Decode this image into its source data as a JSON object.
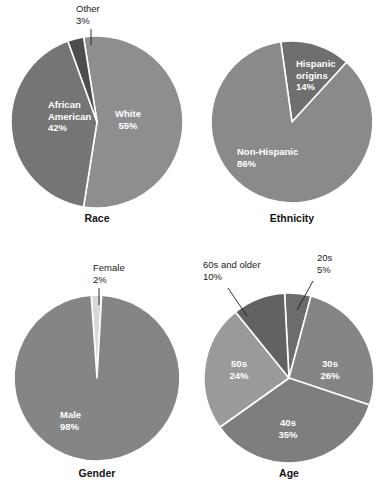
{
  "figure": {
    "background": "#ffffff",
    "slice_border_color": "#ffffff",
    "inner_label_color": "#ffffff",
    "callout_text_color": "#1a1a1a",
    "title_color": "#141414"
  },
  "chart_data": [
    {
      "type": "pie",
      "title": "Race",
      "id": "race",
      "start_angle_deg": -9,
      "legend": "none",
      "grid": false,
      "categories": [
        "White",
        "African American",
        "Other"
      ],
      "values": [
        55,
        42,
        3
      ],
      "slices": [
        {
          "label": "White",
          "value_label": "55%",
          "value": 55,
          "color": "#8e8e8e",
          "label_placement": "inside",
          "label_x": 128,
          "label_y": 117,
          "label_anchor": "middle"
        },
        {
          "label": "African American",
          "value_label": "42%",
          "value": 42,
          "color": "#757575",
          "label_placement": "inside",
          "label_lines": [
            "African",
            "American"
          ],
          "label_x": 48,
          "label_y": 108,
          "label_anchor": "start"
        },
        {
          "label": "Other",
          "value_label": "3%",
          "value": 3,
          "color": "#4d4d4d",
          "label_placement": "callout",
          "label_x": 76,
          "label_y": 12,
          "label_anchor": "start",
          "leader_x1": 91,
          "leader_y1": 29,
          "leader_x2": 91,
          "leader_y2": 45
        }
      ]
    },
    {
      "type": "pie",
      "title": "Ethnicity",
      "id": "ethnicity",
      "start_angle_deg": -8,
      "legend": "none",
      "grid": false,
      "categories": [
        "Non-Hispanic",
        "Hispanic origins"
      ],
      "values": [
        86,
        14
      ],
      "slices": [
        {
          "label": "Hispanic origins",
          "value_label": "14%",
          "value": 14,
          "color": "#6f6f6f",
          "label_placement": "inside",
          "label_lines": [
            "Hispanic",
            "origins"
          ],
          "label_x": 101,
          "label_y": 67,
          "label_anchor": "start"
        },
        {
          "label": "Non-Hispanic",
          "value_label": "86%",
          "value": 86,
          "color": "#8a8a8a",
          "label_placement": "inside",
          "label_x": 42,
          "label_y": 155,
          "label_anchor": "start"
        }
      ]
    },
    {
      "type": "pie",
      "title": "Gender",
      "id": "gender",
      "start_angle_deg": -4,
      "legend": "none",
      "grid": false,
      "categories": [
        "Male",
        "Female"
      ],
      "values": [
        98,
        2
      ],
      "slices": [
        {
          "label": "Female",
          "value_label": "2%",
          "value": 2,
          "color": "#d8d8d8",
          "label_placement": "callout",
          "label_x": 93,
          "label_y": 23,
          "label_anchor": "start",
          "leader_x1": 99,
          "leader_y1": 40,
          "leader_x2": 99,
          "leader_y2": 57
        },
        {
          "label": "Male",
          "value_label": "98%",
          "value": 98,
          "color": "#858585",
          "label_placement": "inside",
          "label_x": 60,
          "label_y": 170,
          "label_anchor": "start"
        }
      ]
    },
    {
      "type": "pie",
      "title": "Age",
      "id": "age",
      "start_angle_deg": -3,
      "legend": "none",
      "grid": false,
      "categories": [
        "20s",
        "30s",
        "40s",
        "50s",
        "60s and older"
      ],
      "values": [
        5,
        26,
        35,
        24,
        10
      ],
      "slices": [
        {
          "label": "20s",
          "value_label": "5%",
          "value": 5,
          "color": "#6c6c6c",
          "label_placement": "callout",
          "label_x": 122,
          "label_y": 13,
          "label_anchor": "start",
          "leader_x1": 118,
          "leader_y1": 33,
          "leader_x2": 102,
          "leader_y2": 62
        },
        {
          "label": "30s",
          "value_label": "26%",
          "value": 26,
          "color": "#858585",
          "label_placement": "inside",
          "label_x": 135,
          "label_y": 119,
          "label_anchor": "middle"
        },
        {
          "label": "40s",
          "value_label": "35%",
          "value": 35,
          "color": "#7e7e7e",
          "label_placement": "inside",
          "label_x": 93,
          "label_y": 178,
          "label_anchor": "middle"
        },
        {
          "label": "50s",
          "value_label": "24%",
          "value": 24,
          "color": "#9a9a9a",
          "label_placement": "inside",
          "label_x": 44,
          "label_y": 119,
          "label_anchor": "middle"
        },
        {
          "label": "60s and older",
          "value_label": "10%",
          "value": 10,
          "color": "#626262",
          "label_placement": "callout",
          "label_x": 8,
          "label_y": 20,
          "label_anchor": "start",
          "leader_x1": 33,
          "leader_y1": 40,
          "leader_x2": 52,
          "leader_y2": 68
        }
      ]
    }
  ],
  "layout": {
    "cells": [
      {
        "id": "race",
        "left": 0,
        "top": 0,
        "cx": 97,
        "cy": 122,
        "r": 86,
        "title_x": 97,
        "title_y": 222
      },
      {
        "id": "ethnicity",
        "left": 195,
        "top": 0,
        "cx": 97,
        "cy": 122,
        "r": 81,
        "title_x": 97,
        "title_y": 222
      },
      {
        "id": "gender",
        "left": 0,
        "top": 248,
        "cx": 97,
        "cy": 130,
        "r": 83,
        "title_x": 97,
        "title_y": 229
      },
      {
        "id": "age",
        "left": 195,
        "top": 248,
        "cx": 94,
        "cy": 130,
        "r": 85,
        "title_x": 94,
        "title_y": 229
      }
    ]
  }
}
